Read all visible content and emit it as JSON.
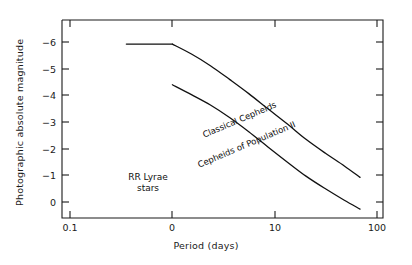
{
  "chart_data": {
    "type": "line",
    "title": "",
    "xlabel": "Period (days)",
    "ylabel": "Photographic absolute magnitude",
    "xscale": "log",
    "xlim": [
      0.07,
      160
    ],
    "ylim": [
      1.0,
      -6.8
    ],
    "grid": false,
    "legend_position": "inline-annotations",
    "x_ticks": [
      {
        "value": 0.1,
        "label": "0.1"
      },
      {
        "value": 1,
        "label": "0"
      },
      {
        "value": 10,
        "label": "10"
      },
      {
        "value": 100,
        "label": "100"
      }
    ],
    "y_ticks": [
      {
        "value": 0,
        "label": "0"
      },
      {
        "value": -1,
        "label": "−1"
      },
      {
        "value": -2,
        "label": "−2"
      },
      {
        "value": -3,
        "label": "−3"
      },
      {
        "value": -4,
        "label": "−4"
      },
      {
        "value": -5,
        "label": "−5"
      },
      {
        "value": -6,
        "label": "−6"
      }
    ],
    "series": [
      {
        "name": "Classical Cepheids",
        "label": "Classical Cepheids",
        "color": "#111111",
        "points": [
          {
            "x": 1.0,
            "y": -1.55
          },
          {
            "x": 1.6,
            "y": -1.95
          },
          {
            "x": 2.5,
            "y": -2.35
          },
          {
            "x": 4.0,
            "y": -2.85
          },
          {
            "x": 6.3,
            "y": -3.4
          },
          {
            "x": 10.0,
            "y": -4.0
          },
          {
            "x": 16.0,
            "y": -4.6
          },
          {
            "x": 25.0,
            "y": -5.15
          },
          {
            "x": 40.0,
            "y": -5.65
          },
          {
            "x": 63.0,
            "y": -6.1
          },
          {
            "x": 92.0,
            "y": -6.45
          }
        ]
      },
      {
        "name": "Cepheids of Population II",
        "label": "Cepheids of Population II",
        "color": "#111111",
        "points": [
          {
            "x": 1.0,
            "y": 0.05
          },
          {
            "x": 1.6,
            "y": -0.35
          },
          {
            "x": 2.5,
            "y": -0.8
          },
          {
            "x": 4.0,
            "y": -1.35
          },
          {
            "x": 6.3,
            "y": -1.9
          },
          {
            "x": 10.0,
            "y": -2.5
          },
          {
            "x": 16.0,
            "y": -3.1
          },
          {
            "x": 25.0,
            "y": -3.7
          },
          {
            "x": 40.0,
            "y": -4.25
          },
          {
            "x": 63.0,
            "y": -4.75
          },
          {
            "x": 92.0,
            "y": -5.2
          }
        ]
      },
      {
        "name": "RR Lyrae stars",
        "label": "RR Lyrae stars",
        "color": "#111111",
        "points": [
          {
            "x": 0.33,
            "y": 0.05
          },
          {
            "x": 1.0,
            "y": 0.05
          }
        ]
      }
    ],
    "annotations": [
      {
        "text": "Classical Cepheids",
        "target": "Classical Cepheids"
      },
      {
        "text": "Cepheids of Population II",
        "target": "Cepheids of Population II"
      },
      {
        "text": "RR Lyrae",
        "target": "RR Lyrae stars"
      },
      {
        "text": "stars",
        "target": "RR Lyrae stars"
      }
    ]
  },
  "axes": {
    "y_title": "Photographic absolute magnitude",
    "x_title": "Period (days)"
  },
  "labels": {
    "classical_cepheids": "Classical Cepheids",
    "pop2_cepheids": "Cepheids of Population II",
    "rr_lyrae_line1": "RR Lyrae",
    "rr_lyrae_line2": "stars"
  },
  "colors": {
    "axis": "#1a1a1a",
    "curve": "#111111",
    "background": "#ffffff"
  }
}
